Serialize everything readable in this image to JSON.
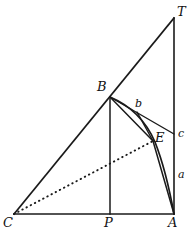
{
  "figure": {
    "canvas": {
      "width": 194,
      "height": 235
    },
    "stroke_color": "#1a1a1a",
    "background_color": "#ffffff",
    "points": {
      "C": {
        "x": 14,
        "y": 214,
        "label": "C",
        "label_x": 4,
        "label_y": 218
      },
      "A": {
        "x": 174,
        "y": 214,
        "label": "A",
        "label_x": 170,
        "label_y": 218
      },
      "T": {
        "x": 174,
        "y": 18,
        "label": "T",
        "label_x": 177,
        "label_y": 7
      },
      "P": {
        "x": 110,
        "y": 214,
        "label": "P",
        "label_x": 105,
        "label_y": 218
      },
      "B": {
        "x": 110,
        "y": 97,
        "label": "B",
        "label_x": 98,
        "label_y": 82
      },
      "E": {
        "x": 153,
        "y": 141,
        "label": "E",
        "label_x": 155,
        "label_y": 132
      },
      "b": {
        "x": 137,
        "y": 112,
        "label": "b",
        "label_x": 135,
        "label_y": 99
      },
      "c": {
        "x": 174,
        "y": 134,
        "label": "c",
        "label_x": 177,
        "label_y": 129
      },
      "a": {
        "x": 174,
        "y": 176,
        "label": "a",
        "label_x": 177,
        "label_y": 169
      }
    },
    "segments": [
      {
        "name": "base-CA",
        "from": "C",
        "to": "A",
        "style": "solid"
      },
      {
        "name": "vertical-AT",
        "from": "A",
        "to": "T",
        "style": "solid"
      },
      {
        "name": "hypotenuse-CT",
        "from": "C",
        "to": "T",
        "style": "solid"
      },
      {
        "name": "altitude-BP",
        "from": "B",
        "to": "P",
        "style": "solid"
      },
      {
        "name": "chord-Bc",
        "from": "B",
        "to": "c",
        "style": "solid"
      },
      {
        "name": "chord-BE",
        "from": "B",
        "to": "E",
        "style": "solid"
      },
      {
        "name": "chord-bE",
        "from": "b",
        "to": "E",
        "style": "solid"
      },
      {
        "name": "chord-EA",
        "from": "E",
        "to": "A",
        "style": "solid"
      },
      {
        "name": "dotted-CE",
        "from": "C",
        "to": "E",
        "style": "dotted"
      }
    ],
    "arcs": [
      {
        "name": "arc-BEA",
        "from": "B",
        "through": "E",
        "to": "A",
        "style": "solid"
      }
    ],
    "labels": [
      {
        "name": "vertex-label-T",
        "key": "T"
      },
      {
        "name": "vertex-label-B",
        "key": "B"
      },
      {
        "name": "vertex-label-E",
        "key": "E"
      },
      {
        "name": "vertex-label-C",
        "key": "C"
      },
      {
        "name": "vertex-label-P",
        "key": "P"
      },
      {
        "name": "vertex-label-A",
        "key": "A"
      },
      {
        "name": "segment-label-b",
        "key": "b"
      },
      {
        "name": "segment-label-c",
        "key": "c"
      },
      {
        "name": "segment-label-a",
        "key": "a"
      }
    ]
  }
}
